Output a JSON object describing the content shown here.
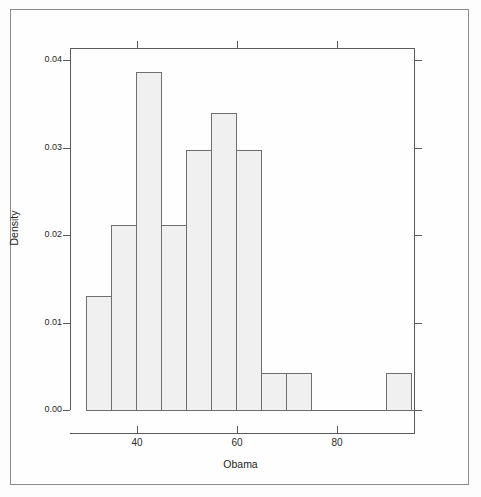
{
  "chart_data": {
    "type": "bar",
    "title": "",
    "subtitle": "",
    "xlabel": "Obama",
    "ylabel": "Density",
    "xlim": [
      30,
      95
    ],
    "ylim": [
      0.0,
      0.04
    ],
    "grid": false,
    "legend": null,
    "bin_width": 5,
    "bin_edges": [
      30,
      35,
      40,
      45,
      50,
      55,
      60,
      65,
      70,
      75,
      80,
      85,
      90,
      95
    ],
    "categories": [
      "30-35",
      "35-40",
      "40-45",
      "45-50",
      "50-55",
      "55-60",
      "60-65",
      "65-70",
      "70-75",
      "75-80",
      "80-85",
      "85-90",
      "90-95"
    ],
    "values": [
      0.013,
      0.0212,
      0.0386,
      0.0212,
      0.0297,
      0.034,
      0.0297,
      0.0042,
      0.0042,
      0.0,
      0.0,
      0.0,
      0.0042
    ],
    "xticks": [
      40,
      60,
      80
    ],
    "xtick_labels": [
      "40",
      "60",
      "80"
    ],
    "yticks": [
      0.0,
      0.01,
      0.02,
      0.03,
      0.04
    ],
    "ytick_labels": [
      "0.00",
      "0.01",
      "0.02",
      "0.03",
      "0.04"
    ],
    "bar_fill": "#f0f0f0",
    "bar_edge": "#6f6f6f",
    "axis_color": "#5a5a5a"
  }
}
